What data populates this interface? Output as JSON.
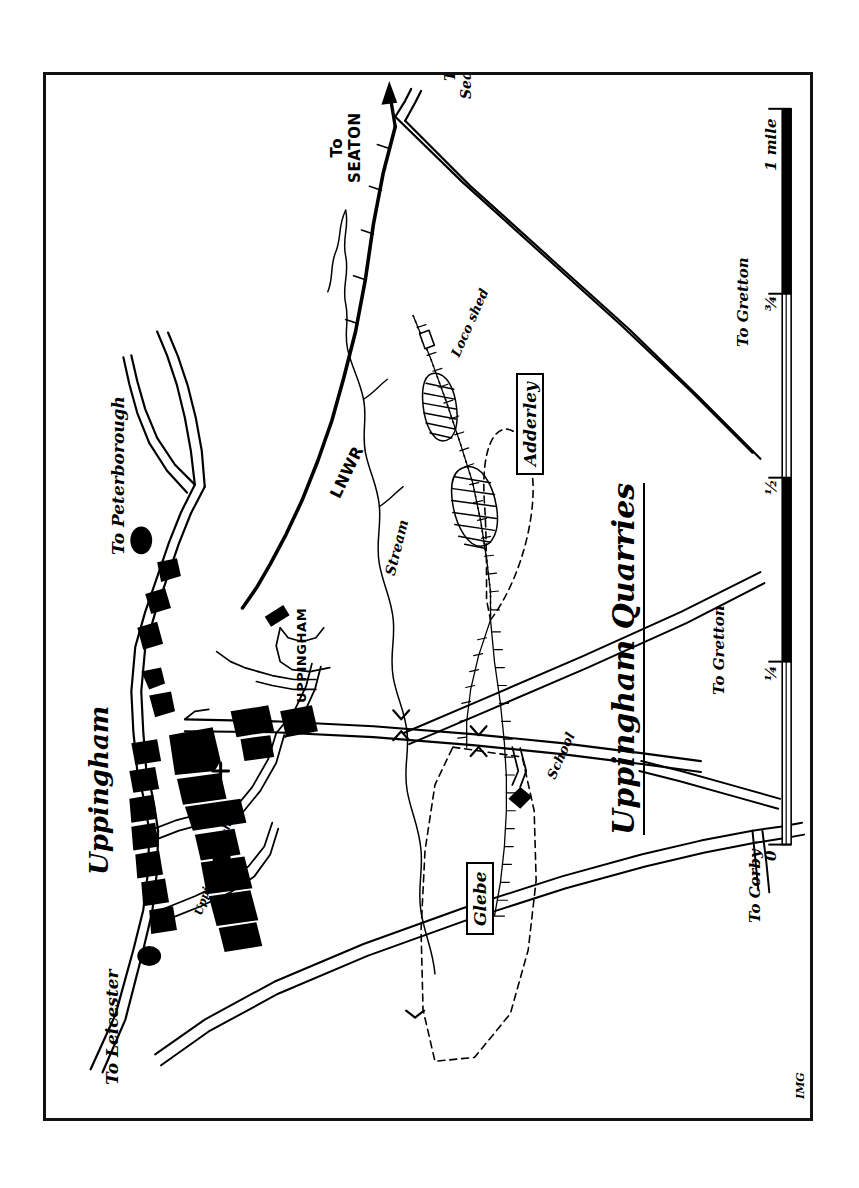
{
  "map": {
    "title": "Uppingham Quarries",
    "signature": "IMG",
    "frame_color": "#111111",
    "ink_color": "#000000",
    "paper_color": "#ffffff",
    "orientation_note": "rotated",
    "place_labels": [
      {
        "id": "uppingham-town",
        "text": "Uppingham",
        "style": "script",
        "size": 26
      },
      {
        "id": "uppingham-school",
        "text": "Uppingham School",
        "style": "script",
        "size": 11
      },
      {
        "id": "uppingham-station",
        "text": "UPPINGHAM",
        "style": "caps",
        "size": 13
      },
      {
        "id": "loco-shed",
        "text": "Loco shed",
        "style": "script",
        "size": 13
      },
      {
        "id": "school",
        "text": "School",
        "style": "script",
        "size": 13
      },
      {
        "id": "stream",
        "text": "Stream",
        "style": "script",
        "size": 14
      },
      {
        "id": "lnwr",
        "text": "LNWR",
        "style": "caps",
        "size": 16
      }
    ],
    "quarry_labels": [
      {
        "id": "adderley",
        "text": "Adderley",
        "boxed": true,
        "size": 17
      },
      {
        "id": "glebe",
        "text": "Glebe",
        "boxed": true,
        "size": 17
      }
    ],
    "direction_labels": [
      {
        "id": "to-seaton-rail",
        "text": "To\nSEATON",
        "style": "caps",
        "size": 15
      },
      {
        "id": "to-seaton-road",
        "text": "To Seaton",
        "style": "script",
        "size": 14
      },
      {
        "id": "to-peterborough",
        "text": "To Peterborough",
        "style": "script",
        "size": 17
      },
      {
        "id": "to-leicester",
        "text": "To Leicester",
        "style": "script",
        "size": 17
      },
      {
        "id": "to-corby",
        "text": "To Corby",
        "style": "script",
        "size": 15
      },
      {
        "id": "to-gretton-upper",
        "text": "To Gretton",
        "style": "script",
        "size": 15
      },
      {
        "id": "to-gretton-lower",
        "text": "To Gretton",
        "style": "script",
        "size": 15
      }
    ],
    "scale_bar": {
      "unit": "mile",
      "ticks": [
        "0",
        "¼",
        "½",
        "¾",
        "1 mile"
      ]
    }
  }
}
